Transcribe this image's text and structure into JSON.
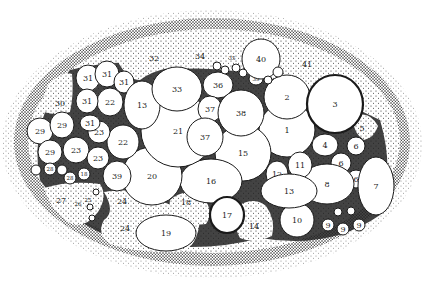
{
  "figure": {
    "kind": "stippled anatomical illustration of numbered cells within an oval body",
    "colors": {
      "ink": "#1a1a1a",
      "paper": "#ffffff",
      "stipple": "#2a2a2a",
      "dark_fill": "#222222"
    }
  },
  "cells": [
    {
      "label": "1",
      "cx": 287,
      "cy": 130,
      "rx": 28,
      "ry": 27
    },
    {
      "label": "2",
      "cx": 287,
      "cy": 97,
      "rx": 23,
      "ry": 22
    },
    {
      "label": "3",
      "cx": 335,
      "cy": 104,
      "rx": 28,
      "ry": 29,
      "thick": true
    },
    {
      "label": "4",
      "cx": 325,
      "cy": 145,
      "rx": 13,
      "ry": 11
    },
    {
      "label": "6",
      "cx": 356,
      "cy": 146,
      "rx": 9,
      "ry": 9
    },
    {
      "label": "6",
      "cx": 341,
      "cy": 163,
      "rx": 10,
      "ry": 10
    },
    {
      "label": "6",
      "cx": 356,
      "cy": 179,
      "rx": 9,
      "ry": 9
    },
    {
      "label": "7",
      "cx": 376,
      "cy": 186,
      "rx": 18,
      "ry": 29
    },
    {
      "label": "8",
      "cx": 327,
      "cy": 184,
      "rx": 27,
      "ry": 20
    },
    {
      "label": "9",
      "cx": 328,
      "cy": 225,
      "rx": 6,
      "ry": 6
    },
    {
      "label": "9",
      "cx": 343,
      "cy": 229,
      "rx": 6,
      "ry": 6
    },
    {
      "label": "9",
      "cx": 359,
      "cy": 225,
      "rx": 6,
      "ry": 6
    },
    {
      "label": "10",
      "cx": 297,
      "cy": 220,
      "rx": 17,
      "ry": 17
    },
    {
      "label": "11",
      "cx": 300,
      "cy": 165,
      "rx": 12,
      "ry": 13
    },
    {
      "label": "12",
      "cx": 277,
      "cy": 174,
      "rx": 11,
      "ry": 13
    },
    {
      "label": "13",
      "cx": 289,
      "cy": 191,
      "rx": 28,
      "ry": 17
    },
    {
      "label": "15",
      "cx": 243,
      "cy": 153,
      "rx": 28,
      "ry": 28
    },
    {
      "label": "16",
      "cx": 211,
      "cy": 181,
      "rx": 31,
      "ry": 22
    },
    {
      "label": "17",
      "cx": 227,
      "cy": 215,
      "rx": 17,
      "ry": 18,
      "thick": true
    },
    {
      "label": "19",
      "cx": 166,
      "cy": 233,
      "rx": 30,
      "ry": 18
    },
    {
      "label": "20",
      "cx": 152,
      "cy": 176,
      "rx": 30,
      "ry": 29
    },
    {
      "label": "21",
      "cx": 178,
      "cy": 131,
      "rx": 37,
      "ry": 36
    },
    {
      "label": "22",
      "cx": 123,
      "cy": 142,
      "rx": 16,
      "ry": 17
    },
    {
      "label": "22",
      "cx": 110,
      "cy": 102,
      "rx": 13,
      "ry": 14
    },
    {
      "label": "23",
      "cx": 99,
      "cy": 132,
      "rx": 11,
      "ry": 11
    },
    {
      "label": "23",
      "cx": 76,
      "cy": 150,
      "rx": 13,
      "ry": 13
    },
    {
      "label": "23",
      "cx": 98,
      "cy": 158,
      "rx": 11,
      "ry": 11
    },
    {
      "label": "29",
      "cx": 40,
      "cy": 131,
      "rx": 13,
      "ry": 13
    },
    {
      "label": "29",
      "cx": 62,
      "cy": 125,
      "rx": 12,
      "ry": 13
    },
    {
      "label": "29",
      "cx": 50,
      "cy": 152,
      "rx": 12,
      "ry": 12
    },
    {
      "label": "28",
      "cx": 50,
      "cy": 169,
      "rx": 6,
      "ry": 6,
      "small": true
    },
    {
      "label": "28",
      "cx": 70,
      "cy": 178,
      "rx": 6,
      "ry": 6,
      "small": true
    },
    {
      "label": "18",
      "cx": 84,
      "cy": 174,
      "rx": 6,
      "ry": 6,
      "small": true
    },
    {
      "label": "31",
      "cx": 88,
      "cy": 78,
      "rx": 12,
      "ry": 13
    },
    {
      "label": "31",
      "cx": 107,
      "cy": 74,
      "rx": 12,
      "ry": 13
    },
    {
      "label": "31",
      "cx": 124,
      "cy": 82,
      "rx": 10,
      "ry": 11
    },
    {
      "label": "31",
      "cx": 87,
      "cy": 101,
      "rx": 11,
      "ry": 12
    },
    {
      "label": "31",
      "cx": 90,
      "cy": 123,
      "rx": 10,
      "ry": 8
    },
    {
      "label": "13",
      "cx": 142,
      "cy": 105,
      "rx": 18,
      "ry": 24
    },
    {
      "label": "33",
      "cx": 177,
      "cy": 89,
      "rx": 25,
      "ry": 22
    },
    {
      "label": "36",
      "cx": 218,
      "cy": 85,
      "rx": 15,
      "ry": 13
    },
    {
      "label": "37",
      "cx": 210,
      "cy": 109,
      "rx": 12,
      "ry": 13
    },
    {
      "label": "37",
      "cx": 205,
      "cy": 137,
      "rx": 18,
      "ry": 19
    },
    {
      "label": "38",
      "cx": 241,
      "cy": 113,
      "rx": 23,
      "ry": 23
    },
    {
      "label": "39",
      "cx": 117,
      "cy": 176,
      "rx": 14,
      "ry": 15
    },
    {
      "label": "39",
      "cx": 256,
      "cy": 79,
      "rx": 7,
      "ry": 6,
      "small": true
    },
    {
      "label": "40",
      "cx": 261,
      "cy": 59,
      "rx": 19,
      "ry": 20
    }
  ],
  "tiny_cells": [
    {
      "cx": 338,
      "cy": 212,
      "r": 4
    },
    {
      "cx": 351,
      "cy": 211,
      "r": 4
    },
    {
      "cx": 217,
      "cy": 66,
      "r": 4
    },
    {
      "cx": 225,
      "cy": 70,
      "r": 4
    },
    {
      "cx": 236,
      "cy": 68,
      "r": 4
    },
    {
      "cx": 243,
      "cy": 73,
      "r": 4
    },
    {
      "cx": 268,
      "cy": 80,
      "r": 4
    },
    {
      "cx": 278,
      "cy": 72,
      "r": 5
    },
    {
      "cx": 96,
      "cy": 192,
      "r": 3
    },
    {
      "cx": 90,
      "cy": 207,
      "r": 3
    },
    {
      "cx": 92,
      "cy": 218,
      "r": 3
    },
    {
      "cx": 36,
      "cy": 170,
      "r": 5
    },
    {
      "cx": 62,
      "cy": 170,
      "r": 5
    }
  ],
  "regions": [
    {
      "label": "5",
      "x": 362,
      "y": 128
    },
    {
      "label": "14",
      "x": 254,
      "y": 226
    },
    {
      "label": "18",
      "x": 186,
      "y": 202
    },
    {
      "label": "24",
      "x": 122,
      "y": 201
    },
    {
      "label": "24",
      "x": 125,
      "y": 228
    },
    {
      "label": "25",
      "x": 88,
      "y": 200,
      "small": true
    },
    {
      "label": "26",
      "x": 78,
      "y": 204,
      "small": true
    },
    {
      "label": "27",
      "x": 61,
      "y": 200
    },
    {
      "label": "30",
      "x": 60,
      "y": 103
    },
    {
      "label": "32",
      "x": 154,
      "y": 58
    },
    {
      "label": "34",
      "x": 200,
      "y": 56
    },
    {
      "label": "35",
      "x": 232,
      "y": 58,
      "small": true
    },
    {
      "label": "41",
      "x": 307,
      "y": 64
    }
  ]
}
